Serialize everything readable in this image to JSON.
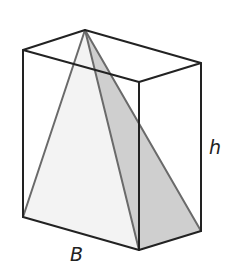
{
  "diagram": {
    "labels": {
      "base": "B",
      "height": "h"
    },
    "colors": {
      "box_edge": "#222222",
      "pyramid_edge": "#6a6a6a",
      "pyramid_light_face": "#f3f3f3",
      "pyramid_dark_face": "#cfcfcf",
      "background": "#ffffff"
    },
    "vertices": {
      "apex": [
        85,
        30
      ],
      "box_top_front_left": [
        23,
        50
      ],
      "box_top_front_right": [
        139,
        82
      ],
      "box_top_back_right": [
        201,
        63
      ],
      "box_bottom_front_left": [
        23,
        217
      ],
      "box_bottom_front_right": [
        139,
        250
      ],
      "box_bottom_back_right": [
        201,
        231
      ]
    }
  }
}
